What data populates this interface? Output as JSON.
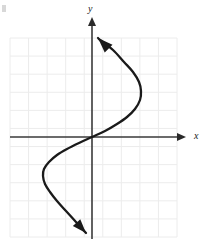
{
  "figure": {
    "name": "cubic-function-graph",
    "background_color": "#ffffff",
    "width": 211,
    "height": 249
  },
  "axes": {
    "x_label": "x",
    "y_label": "y",
    "axis_color": "#3a3a3a",
    "origin_px": {
      "x": 92,
      "y": 137
    },
    "x_axis": {
      "start_px": {
        "x": 10,
        "y": 137
      },
      "end_px": {
        "x": 186,
        "y": 137
      },
      "arrow": "right"
    },
    "y_axis": {
      "start_px": {
        "x": 92,
        "y": 239
      },
      "end_px": {
        "x": 92,
        "y": 18
      },
      "arrow": "up"
    }
  },
  "grid": {
    "color": "#ececec",
    "left_px": 10,
    "top_px": 38,
    "right_px": 177,
    "bottom_px": 237,
    "columns": 9,
    "rows": 11,
    "cell_width_px": 18.56,
    "cell_height_px": 18.09,
    "visible": true
  },
  "chart_data": {
    "type": "line",
    "title": "",
    "subtitle": "",
    "xlabel": "x",
    "ylabel": "y",
    "grid": true,
    "legend_position": "none",
    "xlim": [
      -4.4,
      4.6
    ],
    "ylim": [
      -5.5,
      5.5
    ],
    "curve_color": "#1a1a1a",
    "curve_width_px": 2.3,
    "arrows": {
      "start": {
        "at_px": {
          "x": 86,
          "y": 233
        },
        "direction": "down-right"
      },
      "end": {
        "at_px": {
          "x": 98,
          "y": 38
        },
        "direction": "up-left"
      }
    },
    "series": [
      {
        "name": "curve",
        "points_px": [
          {
            "x": 86,
            "y": 233
          },
          {
            "x": 76,
            "y": 222
          },
          {
            "x": 66,
            "y": 211
          },
          {
            "x": 57,
            "y": 201
          },
          {
            "x": 50,
            "y": 192
          },
          {
            "x": 45,
            "y": 184
          },
          {
            "x": 43,
            "y": 176
          },
          {
            "x": 44,
            "y": 169
          },
          {
            "x": 49,
            "y": 162
          },
          {
            "x": 57,
            "y": 155
          },
          {
            "x": 67,
            "y": 149
          },
          {
            "x": 79,
            "y": 143
          },
          {
            "x": 92,
            "y": 137
          },
          {
            "x": 105,
            "y": 131
          },
          {
            "x": 117,
            "y": 124
          },
          {
            "x": 127,
            "y": 117
          },
          {
            "x": 135,
            "y": 109
          },
          {
            "x": 140,
            "y": 100
          },
          {
            "x": 141,
            "y": 91
          },
          {
            "x": 139,
            "y": 82
          },
          {
            "x": 133,
            "y": 72
          },
          {
            "x": 124,
            "y": 62
          },
          {
            "x": 113,
            "y": 50
          },
          {
            "x": 100,
            "y": 40
          },
          {
            "x": 98,
            "y": 38
          }
        ],
        "points_data": [
          {
            "x": -0.33,
            "y": -5.3
          },
          {
            "x": -0.86,
            "y": -4.7
          },
          {
            "x": -1.4,
            "y": -4.1
          },
          {
            "x": -1.88,
            "y": -3.54
          },
          {
            "x": -2.26,
            "y": -3.04
          },
          {
            "x": -2.53,
            "y": -2.6
          },
          {
            "x": -2.64,
            "y": -2.16
          },
          {
            "x": -2.59,
            "y": -1.77
          },
          {
            "x": -2.32,
            "y": -1.38
          },
          {
            "x": -1.89,
            "y": -1.0
          },
          {
            "x": -1.35,
            "y": -0.66
          },
          {
            "x": -0.7,
            "y": -0.33
          },
          {
            "x": 0,
            "y": 0
          },
          {
            "x": 0.7,
            "y": 0.33
          },
          {
            "x": 1.35,
            "y": 0.72
          },
          {
            "x": 1.89,
            "y": 1.11
          },
          {
            "x": 2.32,
            "y": 1.55
          },
          {
            "x": 2.59,
            "y": 2.05
          },
          {
            "x": 2.64,
            "y": 2.54
          },
          {
            "x": 2.53,
            "y": 3.04
          },
          {
            "x": 2.21,
            "y": 3.6
          },
          {
            "x": 1.72,
            "y": 4.15
          },
          {
            "x": 1.13,
            "y": 4.81
          },
          {
            "x": 0.43,
            "y": 5.36
          },
          {
            "x": 0.32,
            "y": 5.47
          }
        ]
      }
    ],
    "key_features": {
      "x_intercept": {
        "x": 0,
        "y": 0
      },
      "y_intercept": {
        "x": 0,
        "y": 0
      },
      "local_minimum_px": {
        "x": 43,
        "y": 176
      },
      "local_maximum_px": {
        "x": 141,
        "y": 91
      }
    }
  }
}
